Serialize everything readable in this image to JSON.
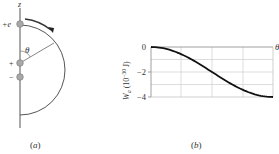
{
  "panel_a": {
    "caption": "(a)",
    "axis_label": "z",
    "charge_top_label": "+e",
    "dipole_plus_label": "+",
    "dipole_minus_label": "−",
    "angle_label": "θ"
  },
  "panel_b": {
    "caption": "(b)",
    "ylabel_main": "W",
    "ylabel_sub": "a",
    "ylabel_unit": " (10",
    "ylabel_exp": "−30",
    "ylabel_tail": " J)",
    "xlabel": "θ",
    "yticks": [
      "0",
      "−2",
      "−4"
    ]
  },
  "chart_data": {
    "type": "line",
    "title": "",
    "xlabel": "θ",
    "ylabel": "W_a (10^-30 J)",
    "x": [
      0,
      0.125,
      0.25,
      0.375,
      0.5,
      0.625,
      0.75,
      0.875,
      1.0
    ],
    "x_note": "theta normalized from 0 to pi (no x tick labels shown)",
    "series": [
      {
        "name": "W_a",
        "values": [
          0,
          -0.15,
          -0.59,
          -1.23,
          -2.0,
          -2.77,
          -3.41,
          -3.85,
          -4.0
        ]
      }
    ],
    "ylim": [
      -4,
      0
    ],
    "yticks": [
      0,
      -2,
      -4
    ],
    "grid": true,
    "legend": "none"
  }
}
